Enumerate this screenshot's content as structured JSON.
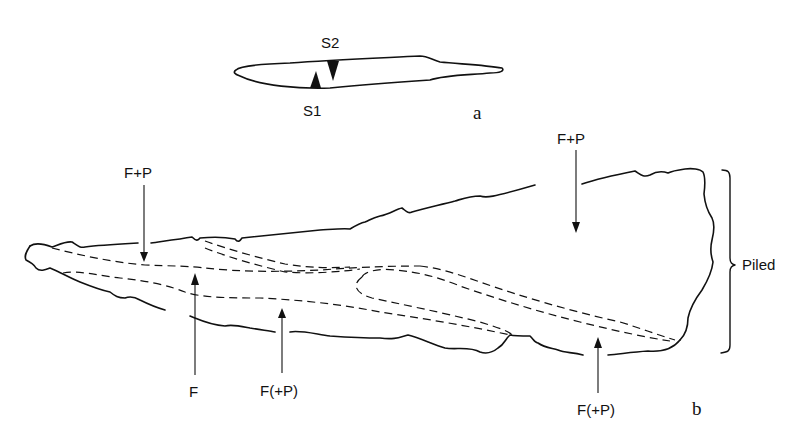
{
  "panel_a": {
    "label": "a",
    "markers": [
      {
        "id": "S1",
        "label": "S1",
        "direction": "up"
      },
      {
        "id": "S2",
        "label": "S2",
        "direction": "down"
      }
    ]
  },
  "panel_b": {
    "label": "b",
    "bracket_label": "Piled",
    "arrows": [
      {
        "label": "F+P",
        "direction": "down",
        "position": "top-left"
      },
      {
        "label": "F+P",
        "direction": "down",
        "position": "top-right"
      },
      {
        "label": "F",
        "direction": "up",
        "position": "bottom-left"
      },
      {
        "label": "F(+P)",
        "direction": "up",
        "position": "bottom-middle"
      },
      {
        "label": "F(+P)",
        "direction": "up",
        "position": "bottom-right"
      }
    ]
  },
  "colors": {
    "ink": "#111111",
    "background": "#ffffff"
  }
}
